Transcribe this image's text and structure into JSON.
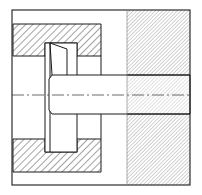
{
  "diagram": {
    "title": "",
    "type": "mechanical cross-section",
    "colors": {
      "line": "#1a1a1a",
      "hatch_coarse": "#333333",
      "hatch_fine": "#555555",
      "background": "#ffffff"
    },
    "parts": [
      {
        "name": "outer-frame",
        "x": 12,
        "y": 10,
        "w": 178,
        "h": 175
      },
      {
        "name": "upper-housing-block",
        "x": 13,
        "y": 24,
        "w": 88,
        "h": 32,
        "hatch": "coarse"
      },
      {
        "name": "lower-housing-block",
        "x": 13,
        "y": 139,
        "w": 88,
        "h": 33,
        "hatch": "coarse"
      },
      {
        "name": "right-fixed-block",
        "x": 127,
        "y": 10,
        "w": 63,
        "h": 175,
        "hatch": "fine"
      },
      {
        "name": "shaft",
        "x": 52,
        "y": 75,
        "w": 138,
        "h": 39
      },
      {
        "name": "key-plate",
        "x": 45,
        "y": 43,
        "w": 32,
        "h": 109
      },
      {
        "name": "centerline",
        "y": 95
      }
    ]
  }
}
